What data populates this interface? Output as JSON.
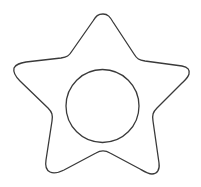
{
  "canvas": {
    "width": 201,
    "height": 187,
    "background_color": "#ffffff",
    "title": "Rounded star outline with inner circle"
  },
  "artwork": {
    "name": "rounded-star-with-circle",
    "style": "line-art",
    "fill": "none",
    "stroke_color": "#3a3a3a",
    "stroke_width": 1.3,
    "shapes": [
      {
        "name": "star-outline",
        "type": "path",
        "description": "Five pointed star with rounded tips and rounded concave notches",
        "points": 5,
        "outer_vertices": [
          {
            "label": "top-point",
            "x": 103,
            "y": 14
          },
          {
            "label": "right-point",
            "x": 189,
            "y": 68
          },
          {
            "label": "bottom-right-point",
            "x": 160,
            "y": 177
          },
          {
            "label": "bottom-left-point",
            "x": 42,
            "y": 177
          },
          {
            "label": "left-point",
            "x": 14,
            "y": 68
          }
        ],
        "inner_vertices": [
          {
            "label": "notch-top-right",
            "x": 140,
            "y": 60
          },
          {
            "label": "notch-right",
            "x": 159,
            "y": 124
          },
          {
            "label": "notch-bottom",
            "x": 102,
            "y": 153
          },
          {
            "label": "notch-left",
            "x": 46,
            "y": 124
          },
          {
            "label": "notch-top-left",
            "x": 66,
            "y": 60
          }
        ],
        "path_d": "M 103 14 C 108 14 110 17 113 22 L 134 54 C 137 59 139 60 145 61 L 182 66 C 188 67 190 70 189 74 C 188 78 185 80 181 84 L 157 108 C 153 112 152 115 153 121 L 159 163 C 160 170 157 174 152 174 C 148 174 145 172 140 169 L 110 153 C 105 150 101 150 96 153 L 64 170 C 58 173 54 174 50 172 C 46 170 45 166 46 160 L 52 121 C 53 115 52 112 48 108 L 20 81 C 15 76 13 72 14 68 C 16 64 20 63 26 62 L 61 58 C 67 57 69 56 72 51 L 93 21 C 96 16 98 14 103 14 Z"
      },
      {
        "name": "inner-circle",
        "type": "circle",
        "description": "Plain circle centered inside the star body",
        "center_x": 102.5,
        "center_y": 106,
        "radius": 36.5
      }
    ]
  }
}
